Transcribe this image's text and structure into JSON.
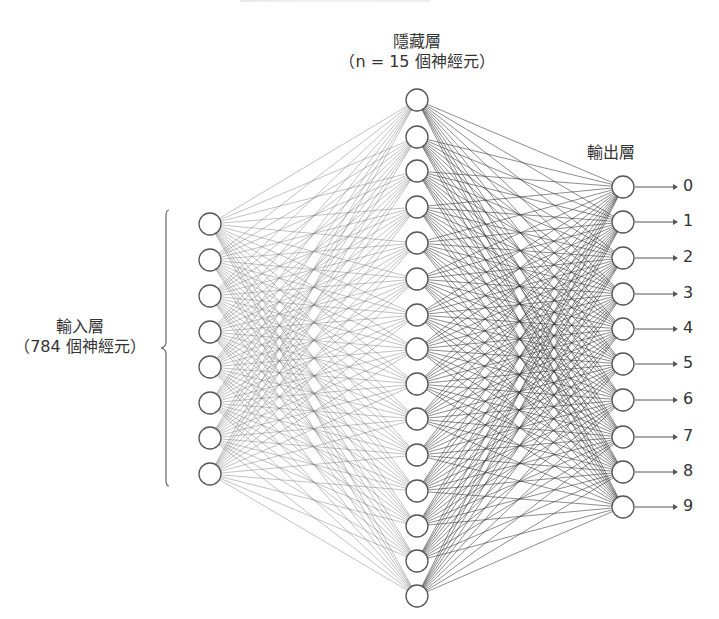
{
  "labels": {
    "hidden_title": "隱藏層",
    "hidden_sub": "（n = 15 個神經元）",
    "input_title": "輸入層",
    "input_sub": "（784 個神經元）",
    "output_title": "輸出層"
  },
  "colors": {
    "node_stroke": "#555555",
    "node_fill": "#ffffff",
    "edge_left": "#777777",
    "edge_right": "#333333",
    "arrow": "#555555",
    "brace": "#666666",
    "text": "#333333"
  },
  "layers": {
    "input": {
      "x": 210,
      "radius": 11,
      "node_count_shown": 8,
      "y": [
        224,
        260,
        296,
        332,
        367,
        403,
        438,
        474
      ]
    },
    "hidden": {
      "x": 417,
      "radius": 11,
      "node_count_shown": 15,
      "y": [
        100,
        137,
        171,
        207,
        243,
        279,
        315,
        349,
        384,
        419,
        455,
        491,
        526,
        561,
        596
      ]
    },
    "output": {
      "x": 623,
      "radius": 11,
      "node_count_shown": 10,
      "y": [
        187,
        222,
        258,
        294,
        329,
        364,
        400,
        437,
        472,
        507
      ],
      "digits": [
        "0",
        "1",
        "2",
        "3",
        "4",
        "5",
        "6",
        "7",
        "8",
        "9"
      ]
    }
  },
  "brace": {
    "x": 166,
    "top": 210,
    "bottom": 486,
    "tip_x": 161,
    "tip_y": 348
  },
  "arrows": {
    "x_start": 635,
    "x_end": 678,
    "label_x": 683
  }
}
